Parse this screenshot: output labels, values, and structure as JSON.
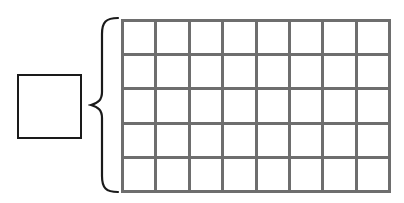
{
  "diagram": {
    "answer_box": {
      "value": ""
    },
    "grid": {
      "rows": 5,
      "columns": 8,
      "line_color": "#6e6e6e"
    },
    "brace": {
      "orientation": "left",
      "color": "#1a1a1a"
    }
  }
}
